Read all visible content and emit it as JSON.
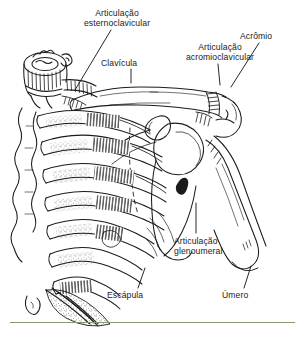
{
  "figure": {
    "style": "pen-and-ink anatomical line drawing",
    "background_color": "#ffffff",
    "ink_color": "#1b1b1b",
    "rule_color": "#8a9a78",
    "labels": [
      {
        "id": "esternoclavicular",
        "line1": "Articulação",
        "line2": "esternoclavicular",
        "text": "Articulação esternoclavicular"
      },
      {
        "id": "clavicula",
        "line1": "Clavícula",
        "line2": "",
        "text": "Clavícula"
      },
      {
        "id": "acromioclavicular",
        "line1": "Articulação",
        "line2": "acromioclavicular",
        "text": "Articulação acromioclavicular"
      },
      {
        "id": "acromio",
        "line1": "Acrômio",
        "line2": "",
        "text": "Acrômio"
      },
      {
        "id": "glenoumeral",
        "line1": "Articulação",
        "line2": "glenoumeral",
        "text": "Articulação glenoumeral"
      },
      {
        "id": "escapula",
        "line1": "Escápula",
        "line2": "",
        "text": "Escápula"
      },
      {
        "id": "umero",
        "line1": "Úmero",
        "line2": "",
        "text": "Úmero"
      }
    ]
  }
}
